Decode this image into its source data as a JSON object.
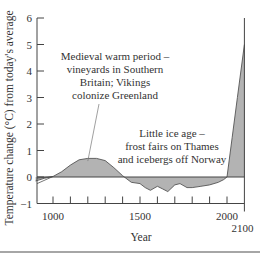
{
  "chart_data": {
    "type": "area",
    "title": "",
    "xlabel": "Year",
    "ylabel": "Temperature change (°C) from today's average",
    "xlim": [
      900,
      2100
    ],
    "ylim": [
      -1,
      6
    ],
    "y_ticks": [
      6,
      5,
      4,
      3,
      2,
      1,
      0,
      -1
    ],
    "x_ticks": [
      1000,
      1100,
      1200,
      1300,
      1400,
      1500,
      1600,
      1700,
      1800,
      1900,
      2000
    ],
    "x_tick_labels": [
      {
        "value": 1000,
        "label": "1000"
      },
      {
        "value": 1500,
        "label": "1500"
      },
      {
        "value": 2000,
        "label": "2000"
      },
      {
        "value": 2100,
        "label": "2100"
      }
    ],
    "baseline": 0,
    "grid": false,
    "series": [
      {
        "name": "Temperature change",
        "x": [
          900,
          950,
          1000,
          1050,
          1100,
          1150,
          1200,
          1250,
          1300,
          1350,
          1400,
          1450,
          1500,
          1530,
          1560,
          1600,
          1630,
          1660,
          1700,
          1730,
          1770,
          1800,
          1850,
          1900,
          1950,
          1980,
          2000,
          2030,
          2060,
          2100
        ],
        "y": [
          -0.15,
          -0.05,
          0.02,
          0.2,
          0.45,
          0.65,
          0.7,
          0.7,
          0.62,
          0.35,
          0.05,
          -0.2,
          -0.25,
          -0.4,
          -0.5,
          -0.35,
          -0.45,
          -0.55,
          -0.3,
          -0.25,
          -0.4,
          -0.4,
          -0.35,
          -0.3,
          -0.2,
          -0.1,
          0.0,
          1.5,
          3.0,
          5.0
        ]
      }
    ],
    "annotations": [
      {
        "name": "medieval-warm-period",
        "lines": [
          "Medieval warm period –",
          "vineyards in Southern",
          "Britain; Vikings",
          "colonize Greenland"
        ],
        "points_to": {
          "x": 1200,
          "y": 0.6
        }
      },
      {
        "name": "little-ice-age",
        "lines": [
          "Little ice age –",
          "frost fairs on Thames",
          "and icebergs off Norway"
        ]
      }
    ],
    "colors": {
      "fill": "#b3b3b3",
      "line": "#555555",
      "axis": "#444444",
      "text": "#333333"
    }
  }
}
